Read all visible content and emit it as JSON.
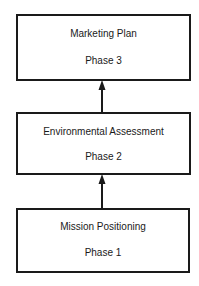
{
  "diagram": {
    "type": "flow",
    "direction": "bottom-to-top",
    "boxes": [
      {
        "title": "Marketing Plan",
        "phase": "Phase 3"
      },
      {
        "title": "Environmental Assessment",
        "phase": "Phase 2"
      },
      {
        "title": "Mission Positioning",
        "phase": "Phase 1"
      }
    ],
    "edges": [
      {
        "from": "Phase 1",
        "to": "Phase 2"
      },
      {
        "from": "Phase 2",
        "to": "Phase 3"
      }
    ],
    "colors": {
      "line": "#1a1a1a",
      "background": "#ffffff"
    }
  }
}
